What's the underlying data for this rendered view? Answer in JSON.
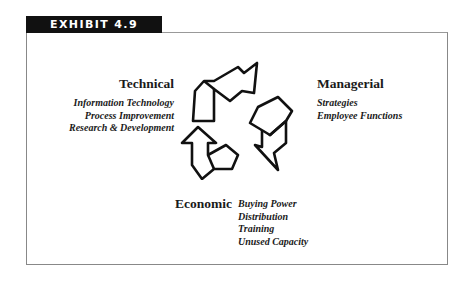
{
  "exhibit_label": "EXHIBIT 4.9",
  "groups": {
    "technical": {
      "title": "Technical",
      "items": [
        "Information Technology",
        "Process Improvement",
        "Research & Development"
      ]
    },
    "managerial": {
      "title": "Managerial",
      "items": [
        "Strategies",
        "Employee Functions"
      ]
    },
    "economic": {
      "title": "Economic",
      "items": [
        "Buying Power",
        "Distribution",
        "Training",
        "Unused Capacity"
      ]
    }
  },
  "center_icon": "recycle-cycle-icon"
}
